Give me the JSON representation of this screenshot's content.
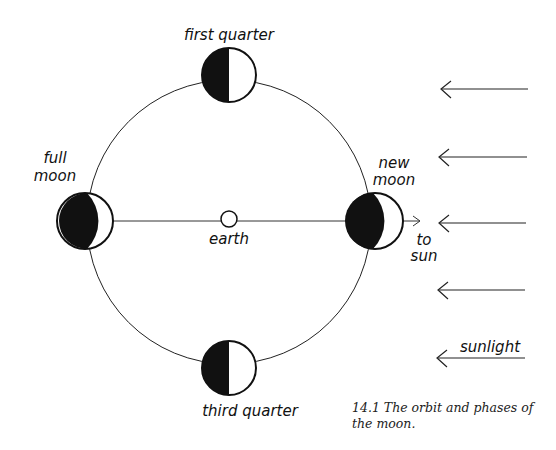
{
  "figure": {
    "caption_line1": "14.1  The orbit and phases of",
    "caption_line2": "the moon.",
    "labels": {
      "first_quarter": "first quarter",
      "full_moon_1": "full",
      "full_moon_2": "moon",
      "new_moon_1": "new",
      "new_moon_2": "moon",
      "earth": "earth",
      "third_quarter": "third quarter",
      "to_sun_1": "to",
      "to_sun_2": "sun",
      "sunlight": "sunlight"
    },
    "colors": {
      "ink": "#111111",
      "background": "#ffffff"
    }
  }
}
